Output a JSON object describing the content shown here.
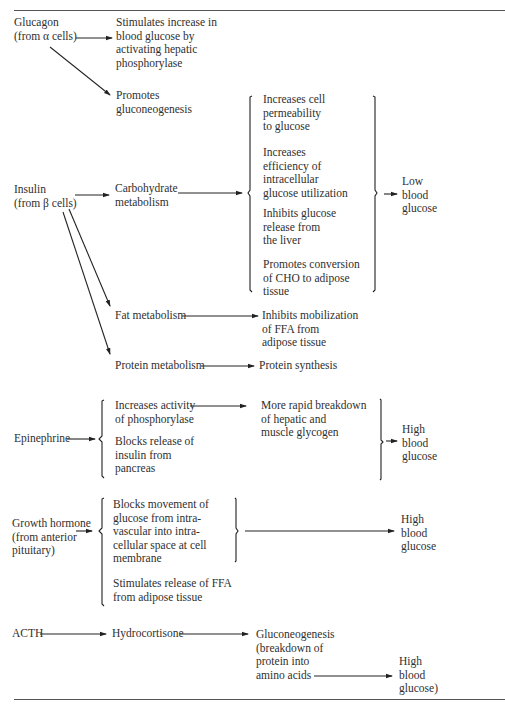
{
  "diagram": {
    "glucagon": {
      "source": "Glucagon\n(from α cells)",
      "effect1": "Stimulates increase in\nblood glucose by\nactivating hepatic\nphosphorylase",
      "effect2": "Promotes\ngluconeogenesis"
    },
    "insulin": {
      "source": "Insulin\n(from β cells)",
      "carb": "Carbohydrate\nmetabolism",
      "carb_effects": [
        "Increases cell\npermeability\nto glucose",
        "Increases\nefficiency of\nintracellular\nglucose utilization",
        "Inhibits glucose\nrelease from\nthe liver",
        "Promotes conversion\nof CHO to adipose\ntissue"
      ],
      "carb_result": "Low\nblood\nglucose",
      "fat": "Fat metabolism",
      "fat_effect": "Inhibits mobilization\nof FFA from\nadipose tissue",
      "protein": "Protein metabolism",
      "protein_effect": "Protein synthesis"
    },
    "epinephrine": {
      "source": "Epinephrine",
      "effect1": "Increases activity\nof phosphorylase",
      "effect1_result": "More rapid breakdown\nof hepatic and\nmuscle glycogen",
      "effect2": "Blocks release of\ninsulin from\npancreas",
      "result": "High\nblood\nglucose"
    },
    "growth_hormone": {
      "source": "Growth hormone\n(from anterior\npituitary)",
      "effect1": "Blocks movement of\nglucose from intra-\nvascular into intra-\ncellular space at cell\nmembrane",
      "effect2": "Stimulates release of FFA\nfrom adipose tissue",
      "result": "High\nblood\nglucose"
    },
    "acth": {
      "source": "ACTH",
      "intermediate": "Hydrocortisone",
      "effect": "Gluconeogenesis\n(breakdown of\nprotein into\namino acids",
      "result": "High\nblood\nglucose)"
    }
  }
}
